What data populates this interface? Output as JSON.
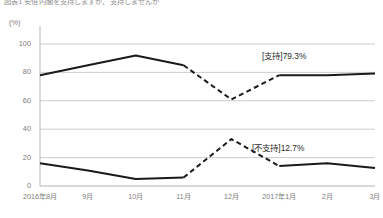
{
  "chart_data": {
    "type": "line",
    "title": "図表1 安倍内閣を支持しますか、支持しませんか",
    "xlabel": "",
    "ylabel": "(%)",
    "ylim": [
      0,
      100
    ],
    "yticks": [
      0,
      20,
      40,
      60,
      80,
      100
    ],
    "ytick_labels": [
      "0",
      "20",
      "40",
      "60",
      "80",
      "100"
    ],
    "grid": true,
    "legend_position": "inline-annotation",
    "categories": [
      "2016年8月",
      "9月",
      "10月",
      "11月",
      "12月",
      "2017年1月",
      "2月",
      "3月"
    ],
    "series": [
      {
        "name": "支持",
        "values": [
          78,
          85,
          92,
          85,
          61,
          78,
          78,
          79.3
        ],
        "style": "solid-dashed-solid",
        "dashed_segment": [
          3,
          5
        ],
        "color": "#1a1a1a",
        "end_label": "[支持]79.3%"
      },
      {
        "name": "不支持",
        "values": [
          16,
          11,
          5,
          6,
          33,
          14,
          16,
          12.7
        ],
        "style": "solid-dashed-solid",
        "dashed_segment": [
          3,
          5
        ],
        "color": "#1a1a1a",
        "end_label": "[不支持]12.7%"
      }
    ],
    "annotations": [
      {
        "text": "[支持]79.3%",
        "series": "支持"
      },
      {
        "text": "[不支持]12.7%",
        "series": "不支持"
      }
    ]
  }
}
